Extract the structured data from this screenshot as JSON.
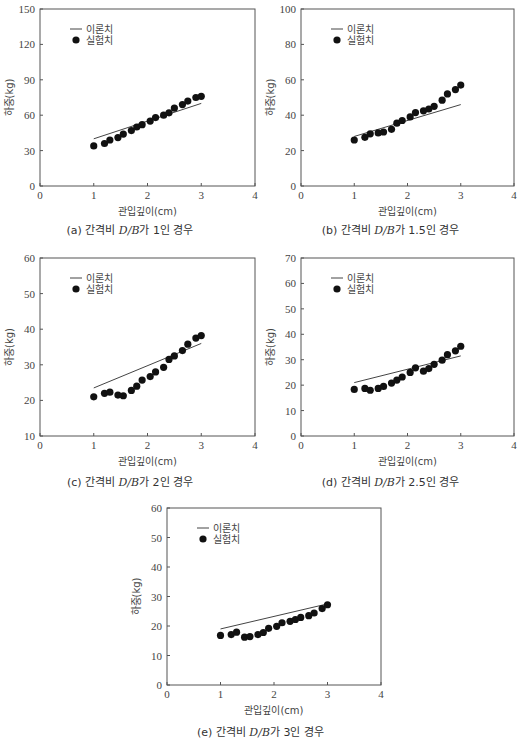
{
  "figure": {
    "legend": {
      "theory_label": "이론치",
      "experiment_label": "실험치"
    },
    "xlabel": "관입깊이(cm)",
    "ylabel": "하중(kg)"
  },
  "chart_data": [
    {
      "id": "a",
      "type": "scatter",
      "caption": {
        "prefix": "(a) 간격비 ",
        "ratio_var": "D/B",
        "suffix": "가 1인 경우"
      },
      "title": "(a) 간격비 D/B가 1인 경우",
      "xlabel": "관입깊이(cm)",
      "ylabel": "하중(kg)",
      "xlim": [
        0,
        4
      ],
      "ylim": [
        0,
        150
      ],
      "xticks": [
        0,
        1,
        2,
        3,
        4
      ],
      "yticks": [
        0,
        30,
        60,
        90,
        120,
        150
      ],
      "grid": false,
      "legend_position": "upper-left",
      "series": [
        {
          "name": "이론치",
          "kind": "line",
          "x": [
            1.0,
            3.0
          ],
          "values": [
            40,
            70
          ]
        },
        {
          "name": "실험치",
          "kind": "scatter",
          "x": [
            1.0,
            1.2,
            1.3,
            1.45,
            1.55,
            1.7,
            1.8,
            1.9,
            2.05,
            2.15,
            2.3,
            2.4,
            2.5,
            2.65,
            2.75,
            2.9,
            3.0
          ],
          "values": [
            34,
            36,
            39,
            41,
            44,
            47,
            50,
            52,
            55,
            58,
            60,
            62,
            66,
            69,
            72,
            75,
            76
          ]
        }
      ]
    },
    {
      "id": "b",
      "type": "scatter",
      "caption": {
        "prefix": "(b) 간격비 ",
        "ratio_var": "D/B",
        "suffix": "가 1.5인 경우"
      },
      "title": "(b) 간격비 D/B가 1.5인 경우",
      "xlabel": "관입깊이(cm)",
      "ylabel": "하중(kg)",
      "xlim": [
        0,
        4
      ],
      "ylim": [
        0,
        100
      ],
      "xticks": [
        0,
        1,
        2,
        3,
        4
      ],
      "yticks": [
        0,
        20,
        40,
        60,
        80,
        100
      ],
      "grid": false,
      "legend_position": "upper-left",
      "series": [
        {
          "name": "이론치",
          "kind": "line",
          "x": [
            1.0,
            3.0
          ],
          "values": [
            28,
            46
          ]
        },
        {
          "name": "실험치",
          "kind": "scatter",
          "x": [
            1.0,
            1.2,
            1.3,
            1.45,
            1.55,
            1.7,
            1.8,
            1.9,
            2.05,
            2.15,
            2.3,
            2.4,
            2.5,
            2.65,
            2.75,
            2.9,
            3.0
          ],
          "values": [
            26,
            27.5,
            29.5,
            30,
            30.5,
            32,
            35.5,
            37,
            39,
            41.5,
            42.5,
            43.5,
            45,
            48.5,
            52,
            54.5,
            57
          ]
        }
      ]
    },
    {
      "id": "c",
      "type": "scatter",
      "caption": {
        "prefix": "(c) 간격비 ",
        "ratio_var": "D/B",
        "suffix": "가 2인 경우"
      },
      "title": "(c) 간격비 D/B가 2인 경우",
      "xlabel": "관입깊이(cm)",
      "ylabel": "하중(kg)",
      "xlim": [
        0,
        4
      ],
      "ylim": [
        10,
        60
      ],
      "xticks": [
        0,
        1,
        2,
        3,
        4
      ],
      "yticks": [
        10,
        20,
        30,
        40,
        50,
        60
      ],
      "grid": false,
      "legend_position": "upper-left",
      "series": [
        {
          "name": "이론치",
          "kind": "line",
          "x": [
            1.0,
            3.0
          ],
          "values": [
            23.5,
            36
          ]
        },
        {
          "name": "실험치",
          "kind": "scatter",
          "x": [
            1.0,
            1.2,
            1.3,
            1.45,
            1.55,
            1.7,
            1.8,
            1.9,
            2.05,
            2.15,
            2.3,
            2.4,
            2.5,
            2.65,
            2.75,
            2.9,
            3.0
          ],
          "values": [
            21,
            22,
            22.3,
            21.5,
            21.3,
            22.8,
            24,
            25.7,
            26.7,
            28,
            29.3,
            31.5,
            32.5,
            34,
            35.8,
            37.5,
            38.2
          ]
        }
      ]
    },
    {
      "id": "d",
      "type": "scatter",
      "caption": {
        "prefix": "(d) 간격비 ",
        "ratio_var": "D/B",
        "suffix": "가 2.5인 경우"
      },
      "title": "(d) 간격비 D/B가 2.5인 경우",
      "xlabel": "관입깊이(cm)",
      "ylabel": "하중(kg)",
      "xlim": [
        0,
        4
      ],
      "ylim": [
        0,
        70
      ],
      "xticks": [
        0,
        1,
        2,
        3,
        4
      ],
      "yticks": [
        0,
        10,
        20,
        30,
        40,
        50,
        60,
        70
      ],
      "grid": false,
      "legend_position": "upper-left",
      "series": [
        {
          "name": "이론치",
          "kind": "line",
          "x": [
            1.0,
            3.0
          ],
          "values": [
            21,
            31.5
          ]
        },
        {
          "name": "실험치",
          "kind": "scatter",
          "x": [
            1.0,
            1.2,
            1.3,
            1.45,
            1.55,
            1.7,
            1.8,
            1.9,
            2.05,
            2.15,
            2.3,
            2.4,
            2.5,
            2.65,
            2.75,
            2.9,
            3.0
          ],
          "values": [
            18.3,
            18.7,
            18,
            18.7,
            19.5,
            20.8,
            22,
            23.2,
            25,
            26.8,
            25.5,
            26.5,
            28.2,
            29.8,
            32,
            33.5,
            35.3
          ]
        }
      ]
    },
    {
      "id": "e",
      "type": "scatter",
      "caption": {
        "prefix": "(e) 간격비 ",
        "ratio_var": "D/B",
        "suffix": "가 3인 경우"
      },
      "title": "(e) 간격비 D/B가 3인 경우",
      "xlabel": "관입깊이(cm)",
      "ylabel": "하중(kg)",
      "xlim": [
        0,
        4
      ],
      "ylim": [
        0,
        60
      ],
      "xticks": [
        0,
        1,
        2,
        3,
        4
      ],
      "yticks": [
        0,
        10,
        20,
        30,
        40,
        50,
        60
      ],
      "grid": false,
      "legend_position": "upper-left",
      "series": [
        {
          "name": "이론치",
          "kind": "line",
          "x": [
            1.0,
            3.0
          ],
          "values": [
            19,
            27.5
          ]
        },
        {
          "name": "실험치",
          "kind": "scatter",
          "x": [
            1.0,
            1.2,
            1.3,
            1.45,
            1.55,
            1.7,
            1.8,
            1.9,
            2.05,
            2.15,
            2.3,
            2.4,
            2.5,
            2.65,
            2.75,
            2.9,
            3.0
          ],
          "values": [
            16.8,
            17.1,
            17.9,
            16.2,
            16.4,
            17.1,
            17.8,
            19.2,
            19.9,
            21.1,
            21.6,
            22.2,
            22.9,
            23.5,
            24.4,
            25.9,
            27.2
          ]
        }
      ]
    }
  ]
}
